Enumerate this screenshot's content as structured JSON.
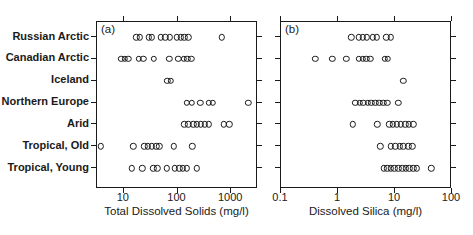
{
  "figure": {
    "background": "#ffffff",
    "frame_color": "#1a1a1a",
    "marker": {
      "shape": "open-circle",
      "stroke": "#1a1a1a"
    },
    "categories": [
      "Russian Arctic",
      "Canadian Arctic",
      "Iceland",
      "Northern Europe",
      "Arid",
      "Tropical, Old",
      "Tropical, Young"
    ],
    "panels": [
      {
        "label": "(a)",
        "xlabel": "Total Dissolved Solids (mg/l)",
        "tick_labels": [
          "10",
          "100",
          "1000"
        ]
      },
      {
        "label": "(b)",
        "xlabel": "Dissolved Silica (mg/l)",
        "tick_labels": [
          "0.1",
          "1",
          "10",
          "100"
        ]
      }
    ]
  },
  "chart_data": [
    {
      "type": "scatter",
      "subtype": "strip-plot",
      "title": "(a)",
      "xlabel": "Total Dissolved Solids (mg/l)",
      "x_scale": "log",
      "xlim": [
        3.162,
        3162
      ],
      "x_ticks": [
        10,
        100,
        1000
      ],
      "grid": false,
      "categories": [
        "Russian Arctic",
        "Canadian Arctic",
        "Iceland",
        "Northern Europe",
        "Arid",
        "Tropical, Old",
        "Tropical, Young"
      ],
      "series": [
        {
          "name": "Russian Arctic",
          "values": [
            17,
            20,
            29,
            33,
            49,
            59,
            71,
            97,
            115,
            135,
            158,
            670
          ]
        },
        {
          "name": "Canadian Arctic",
          "values": [
            9,
            10.5,
            12,
            19,
            23,
            36,
            70,
            104,
            132,
            153,
            182
          ]
        },
        {
          "name": "Iceland",
          "values": [
            65,
            75
          ]
        },
        {
          "name": "Northern Europe",
          "values": [
            150,
            185,
            265,
            380,
            455,
            2100
          ]
        },
        {
          "name": "Arid",
          "values": [
            135,
            160,
            195,
            230,
            270,
            320,
            380,
            720,
            915
          ]
        },
        {
          "name": "Tropical, Old",
          "values": [
            3.7,
            15,
            24,
            28,
            33,
            40,
            46,
            86,
            190
          ]
        },
        {
          "name": "Tropical, Young",
          "values": [
            14,
            22,
            35,
            42,
            63,
            89,
            107,
            126,
            148,
            228
          ]
        }
      ]
    },
    {
      "type": "scatter",
      "subtype": "strip-plot",
      "title": "(b)",
      "xlabel": "Dissolved Silica (mg/l)",
      "x_scale": "log",
      "xlim": [
        0.1,
        100
      ],
      "x_ticks": [
        0.1,
        1,
        10,
        100
      ],
      "grid": false,
      "categories": [
        "Russian Arctic",
        "Canadian Arctic",
        "Iceland",
        "Northern Europe",
        "Arid",
        "Tropical, Old",
        "Tropical, Young"
      ],
      "series": [
        {
          "name": "Russian Arctic",
          "values": [
            1.7,
            2.3,
            2.7,
            3.2,
            4.1,
            4.8,
            7.0,
            8.4
          ]
        },
        {
          "name": "Canadian Arctic",
          "values": [
            0.4,
            0.8,
            1.4,
            2.3,
            2.7,
            3.1,
            3.7,
            6.6,
            7.5
          ]
        },
        {
          "name": "Iceland",
          "values": [
            14
          ]
        },
        {
          "name": "Northern Europe",
          "values": [
            2.0,
            2.4,
            2.8,
            3.3,
            3.8,
            4.5,
            5.3,
            6.2,
            7.3,
            11.5
          ]
        },
        {
          "name": "Arid",
          "values": [
            1.8,
            4.9,
            7.9,
            9.2,
            10.8,
            12.7,
            15,
            17.6,
            20.7
          ]
        },
        {
          "name": "Tropical, Old",
          "values": [
            5.5,
            8.5,
            10,
            12,
            14,
            17,
            20
          ]
        },
        {
          "name": "Tropical, Young",
          "values": [
            6.3,
            7.3,
            8.5,
            9.8,
            11.4,
            13.3,
            15.4,
            17.8,
            20.7,
            24,
            43
          ]
        }
      ]
    }
  ]
}
